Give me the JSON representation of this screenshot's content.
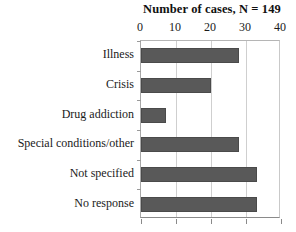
{
  "chart_data": {
    "type": "bar",
    "orientation": "horizontal",
    "title": "Number of cases, N = 149",
    "xlabel": "",
    "ylabel": "",
    "xlim": [
      0,
      40
    ],
    "xticks": [
      0,
      10,
      20,
      30,
      40
    ],
    "grid": true,
    "legend": "none",
    "axis_position": "top",
    "categories": [
      "Illness",
      "Crisis",
      "Drug addiction",
      "Special conditions/other",
      "Not specified",
      "No response"
    ],
    "values": [
      28,
      20,
      7,
      28,
      33,
      33
    ],
    "bar_color": "#595959",
    "total_n": 149
  }
}
